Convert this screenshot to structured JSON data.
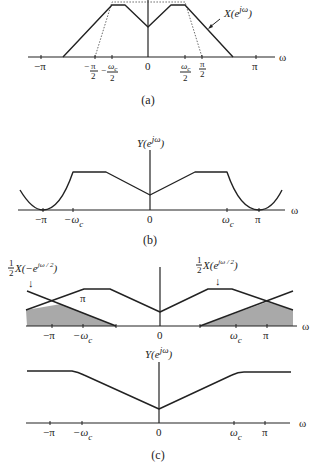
{
  "panels": {
    "a": {
      "caption": "(a)",
      "curve_label": "X(e",
      "curve_label_sup": "jω",
      "curve_label_close": ")",
      "axis_label": "ω",
      "ticks": {
        "neg_pi": "−π",
        "neg_pi_half_num": "π",
        "neg_pi_half_den": "2",
        "minus": "−",
        "neg_wc_half_num": "ω",
        "neg_wc_half_sub": "c",
        "neg_wc_half_den": "2",
        "zero": "0",
        "wc_half_num": "ω",
        "wc_half_sub": "c",
        "wc_half_den": "2",
        "pi_half_num": "π",
        "pi_half_den": "2",
        "pi": "π",
        "neg_sign": "−"
      }
    },
    "b": {
      "caption": "(b)",
      "curve_label": "Y(e",
      "curve_label_sup": "jω",
      "curve_label_close": ")",
      "axis_label": "ω",
      "ticks": {
        "neg_pi": "−π",
        "neg_wc": "−ω",
        "neg_wc_sub": "c",
        "zero": "0",
        "wc": "ω",
        "wc_sub": "c",
        "pi": "π"
      }
    },
    "c_top": {
      "left_label_frac_num": "1",
      "left_label_frac_den": "2",
      "left_label": "X(−e",
      "left_label_sup": "jω / 2",
      "left_label_close": ")",
      "right_label_frac_num": "1",
      "right_label_frac_den": "2",
      "right_label": "X(e",
      "right_label_sup": "jω / 2",
      "right_label_close": ")",
      "arrow": "↓",
      "inner_pi": "π",
      "axis_label": "ω",
      "ticks": {
        "neg_pi": "−π",
        "neg_wc": "−ω",
        "neg_wc_sub": "c",
        "zero": "0",
        "wc": "ω",
        "wc_sub": "c",
        "pi": "π"
      }
    },
    "c_bottom": {
      "caption": "(c)",
      "curve_label": "Y(e",
      "curve_label_sup": "jω",
      "curve_label_close": ")",
      "axis_label": "ω",
      "ticks": {
        "neg_pi": "−π",
        "neg_wc": "−ω",
        "neg_wc_sub": "c",
        "zero": "0",
        "wc": "ω",
        "wc_sub": "c",
        "pi": "π"
      }
    }
  },
  "colors": {
    "line": "#222222",
    "shade": "#a9a9a9",
    "background": "#ffffff"
  }
}
